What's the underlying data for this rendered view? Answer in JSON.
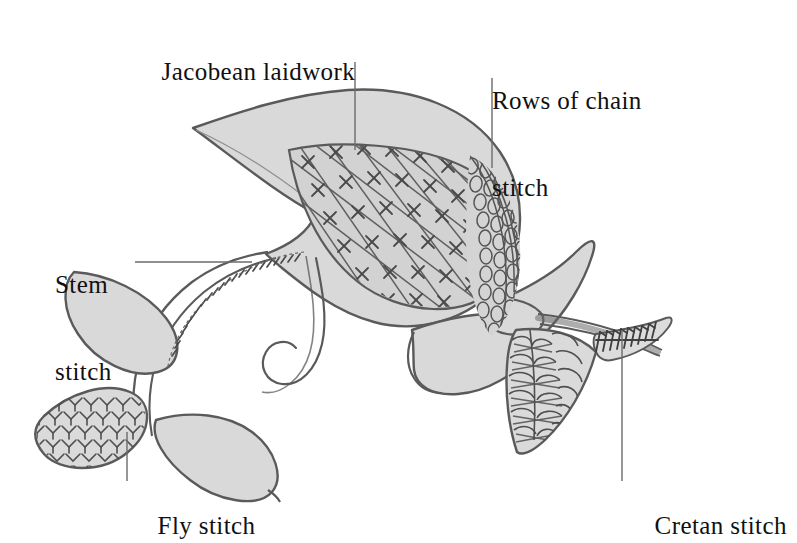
{
  "figure": {
    "background_color": "#ffffff",
    "fill_color": "#d9d9d9",
    "fill_color_dark": "#cfcfcf",
    "outline_color": "#555555",
    "stitch_color": "#4d4d4d",
    "leader_color": "#6b6b6b",
    "text_color": "#101010"
  },
  "labels": {
    "jacobean": "Jacobean laidwork",
    "chain_line1": "Rows of chain",
    "chain_line2": "stitch",
    "stem_line1": "Stem",
    "stem_line2": "stitch",
    "fly": "Fly stitch",
    "cretan": "Cretan stitch"
  },
  "leaders": [
    {
      "name": "jacobean-leader",
      "from": [
        355,
        62
      ],
      "to": [
        355,
        150
      ]
    },
    {
      "name": "chain-leader",
      "from": [
        492,
        78
      ],
      "to": [
        492,
        168
      ]
    },
    {
      "name": "stem-leader",
      "from": [
        135,
        262
      ],
      "to": [
        250,
        262
      ]
    },
    {
      "name": "fly-leader",
      "from": [
        127,
        432
      ],
      "to": [
        127,
        481
      ]
    },
    {
      "name": "cretan-leader",
      "from": [
        622,
        330
      ],
      "to": [
        622,
        481
      ]
    }
  ],
  "stitch_regions": [
    {
      "name": "jacobean-laidwork",
      "pattern": "lattice grid with cross stitches at intersections"
    },
    {
      "name": "chain-stitch",
      "pattern": "rows of small oval chain loops"
    },
    {
      "name": "stem-stitch",
      "pattern": "slanted overlapping stitches along stem line"
    },
    {
      "name": "fly-stitch",
      "pattern": "rows of V chevrons"
    },
    {
      "name": "cretan-stitch",
      "pattern": "interlaced braided scales"
    },
    {
      "name": "cretan-bud-tip",
      "pattern": "feathered comb stitches on bud tip"
    }
  ]
}
